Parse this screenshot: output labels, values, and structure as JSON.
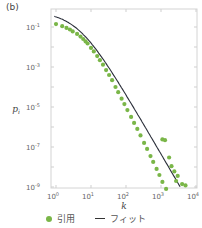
{
  "panel_label": "(b)",
  "legend": {
    "data_label": "引用",
    "fit_label": "フィット"
  },
  "colors": {
    "data": "#7ab648",
    "fit": "#2b2f3a",
    "frame": "#cfcfcf"
  },
  "chart_data": {
    "type": "scatter",
    "title": "",
    "panel": "(b)",
    "xlabel": "k",
    "ylabel": "p_i",
    "xscale": "log",
    "yscale": "log",
    "xlim": [
      0.7,
      10000
    ],
    "ylim": [
      1e-09,
      1
    ],
    "x_ticks": [
      "10^0",
      "10^1",
      "10^2",
      "10^3",
      "10^4"
    ],
    "y_ticks": [
      "10^-1",
      "10^-3",
      "10^-5",
      "10^-7",
      "10^-9"
    ],
    "grid": false,
    "legend_position": "bottom",
    "series": [
      {
        "name": "引用",
        "kind": "scatter",
        "color": "#7ab648",
        "points": [
          [
            1,
            0.14
          ],
          [
            1.5,
            0.11
          ],
          [
            2,
            0.09
          ],
          [
            2.5,
            0.075
          ],
          [
            3,
            0.06
          ],
          [
            4,
            0.045
          ],
          [
            5,
            0.033
          ],
          [
            6,
            0.025
          ],
          [
            7,
            0.019
          ],
          [
            8,
            0.015
          ],
          [
            10,
            0.009
          ],
          [
            12,
            0.006
          ],
          [
            15,
            0.0035
          ],
          [
            18,
            0.0022
          ],
          [
            22,
            0.0013
          ],
          [
            27,
            0.0007
          ],
          [
            33,
            0.0004
          ],
          [
            40,
            0.00022
          ],
          [
            50,
            0.0001
          ],
          [
            60,
            5.5e-05
          ],
          [
            75,
            2.6e-05
          ],
          [
            90,
            1.4e-05
          ],
          [
            110,
            7e-06
          ],
          [
            140,
            3.2e-06
          ],
          [
            170,
            1.6e-06
          ],
          [
            210,
            8e-07
          ],
          [
            260,
            3.8e-07
          ],
          [
            330,
            1.6e-07
          ],
          [
            400,
            8e-08
          ],
          [
            500,
            3.5e-08
          ],
          [
            600,
            1.8e-08
          ],
          [
            750,
            8e-09
          ],
          [
            900,
            4e-09
          ],
          [
            1100,
            1.8e-09
          ],
          [
            1400,
            8e-10
          ],
          [
            1100,
            2.4e-07
          ],
          [
            1300,
            2.2e-07
          ],
          [
            1700,
            3e-08
          ],
          [
            2000,
            1.1e-08
          ],
          [
            2400,
            6e-09
          ],
          [
            2700,
            2e-09
          ],
          [
            3000,
            3.6e-09
          ],
          [
            4000,
            1.4e-09
          ],
          [
            5000,
            1.2e-09
          ]
        ]
      },
      {
        "name": "フィット",
        "kind": "line",
        "color": "#2b2f3a"
      }
    ]
  }
}
